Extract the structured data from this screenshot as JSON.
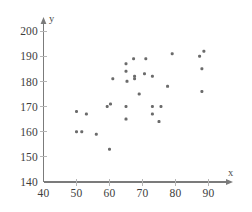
{
  "chart_data": {
    "type": "scatter",
    "title": "",
    "xlabel": "x",
    "ylabel": "y",
    "xlim": [
      40,
      95
    ],
    "ylim": [
      140,
      203
    ],
    "xticks": [
      40,
      50,
      60,
      70,
      80,
      90
    ],
    "yticks": [
      140,
      150,
      160,
      170,
      180,
      190,
      200
    ],
    "xtick_labels": [
      "40",
      "50",
      "60",
      "70",
      "80",
      "90"
    ],
    "ytick_labels": [
      "140",
      "150",
      "160",
      "170",
      "180",
      "190",
      "200"
    ],
    "grid": false,
    "legend": null,
    "marker_color": "#6b6b6b",
    "axis_color": "#7b7b7b",
    "points": [
      {
        "x": 50.0,
        "y": 168
      },
      {
        "x": 50.0,
        "y": 160
      },
      {
        "x": 51.6,
        "y": 160
      },
      {
        "x": 53.0,
        "y": 167
      },
      {
        "x": 56.0,
        "y": 159
      },
      {
        "x": 59.3,
        "y": 170
      },
      {
        "x": 60.3,
        "y": 171
      },
      {
        "x": 60.0,
        "y": 153
      },
      {
        "x": 61.0,
        "y": 181
      },
      {
        "x": 65.0,
        "y": 187
      },
      {
        "x": 65.0,
        "y": 184
      },
      {
        "x": 65.3,
        "y": 180
      },
      {
        "x": 65.0,
        "y": 170
      },
      {
        "x": 65.0,
        "y": 165
      },
      {
        "x": 67.3,
        "y": 189
      },
      {
        "x": 67.6,
        "y": 182
      },
      {
        "x": 67.6,
        "y": 181
      },
      {
        "x": 69.0,
        "y": 175
      },
      {
        "x": 70.6,
        "y": 183
      },
      {
        "x": 71.0,
        "y": 189
      },
      {
        "x": 73.0,
        "y": 182
      },
      {
        "x": 73.0,
        "y": 170
      },
      {
        "x": 73.0,
        "y": 167
      },
      {
        "x": 75.6,
        "y": 170
      },
      {
        "x": 75.0,
        "y": 164
      },
      {
        "x": 77.6,
        "y": 178
      },
      {
        "x": 79.0,
        "y": 191
      },
      {
        "x": 87.3,
        "y": 190
      },
      {
        "x": 88.6,
        "y": 192
      },
      {
        "x": 88.0,
        "y": 185
      },
      {
        "x": 88.0,
        "y": 176
      }
    ]
  }
}
